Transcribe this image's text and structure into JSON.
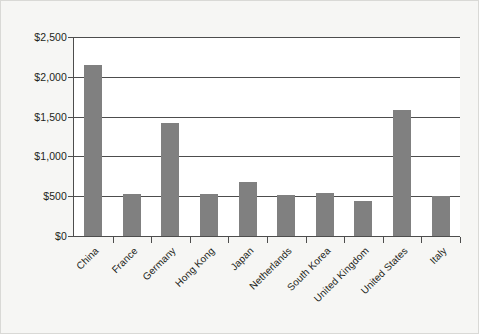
{
  "chart_data": {
    "type": "bar",
    "title": "",
    "subtitle": "",
    "xlabel": "",
    "ylabel": "",
    "categories": [
      "China",
      "France",
      "Germany",
      "Hong Kong",
      "Japan",
      "Netherlands",
      "South Korea",
      "United Kingdom",
      "United States",
      "Italy"
    ],
    "values": [
      2150,
      530,
      1420,
      525,
      680,
      520,
      545,
      440,
      1580,
      505
    ],
    "ylim": [
      0,
      2500
    ],
    "ytick_values": [
      0,
      500,
      1000,
      1500,
      2000,
      2500
    ],
    "ytick_labels": [
      "$0",
      "$500",
      "$1,000",
      "$1,500",
      "$2,000",
      "$2,500"
    ],
    "grid": true,
    "legend": false,
    "legend_position": "none",
    "bar_color": "#808080",
    "axis_color": "#4d4d4d",
    "plot_background": "#ffffff",
    "page_background": "#f6f6f4",
    "border_color": "#d9d9d6",
    "xtick_label_rotation": -45
  }
}
